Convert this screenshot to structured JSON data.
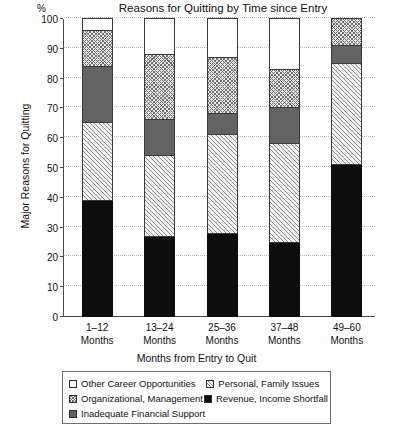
{
  "chart_data": {
    "type": "bar",
    "subtype": "stacked-bar-100",
    "title": "Reasons for Quitting by Time since Entry",
    "xlabel": "Months from Entry to Quit",
    "ylabel": "Major Reasons for Quitting",
    "unit_label": "%",
    "categories": [
      "1–12\nMonths",
      "13–24\nMonths",
      "25–36\nMonths",
      "37–48\nMonths",
      "49–60\nMonths"
    ],
    "category_lines": [
      [
        "1–12",
        "Months"
      ],
      [
        "13–24",
        "Months"
      ],
      [
        "25–36",
        "Months"
      ],
      [
        "37–48",
        "Months"
      ],
      [
        "49–60",
        "Months"
      ]
    ],
    "ylim": [
      0,
      100
    ],
    "yticks": [
      0,
      10,
      20,
      30,
      40,
      50,
      60,
      70,
      80,
      90,
      100
    ],
    "ytick_labels": [
      "0",
      "10",
      "20",
      "30",
      "40",
      "50",
      "60",
      "70",
      "80",
      "90",
      "100"
    ],
    "grid": true,
    "grid_axis": "y",
    "grid_style": "dotted",
    "legend_position": "bottom",
    "stack_order_bottom_to_top": [
      "Revenue, Income Shortfall",
      "Personal, Family Issues",
      "Inadequate Financial Support",
      "Organizational, Management",
      "Other Career Opportunities"
    ],
    "series": [
      {
        "name": "Revenue, Income Shortfall",
        "pattern": "solid-black",
        "color": "#0d0d0d",
        "values": [
          39,
          27,
          28,
          25,
          51
        ]
      },
      {
        "name": "Personal, Family Issues",
        "pattern": "diagonal-hatch",
        "color": "#f2f2f2",
        "values": [
          26,
          27,
          33,
          33,
          34
        ]
      },
      {
        "name": "Inadequate Financial Support",
        "pattern": "solid-dark-gray",
        "color": "#636363",
        "values": [
          19,
          12,
          7,
          12,
          6
        ]
      },
      {
        "name": "Organizational, Management",
        "pattern": "crosshatch-dot",
        "color": "#e8e8e8",
        "values": [
          12,
          22,
          19,
          13,
          9
        ]
      },
      {
        "name": "Other Career Opportunities",
        "pattern": "empty-white",
        "color": "#ffffff",
        "values": [
          4,
          12,
          13,
          17,
          0
        ]
      }
    ],
    "cumulative_tops": [
      [
        39,
        65,
        84,
        96,
        100
      ],
      [
        27,
        54,
        66,
        88,
        100
      ],
      [
        28,
        61,
        68,
        87,
        100
      ],
      [
        25,
        58,
        70,
        83,
        100
      ],
      [
        51,
        85,
        91,
        100,
        100
      ]
    ]
  },
  "legend": {
    "rows": [
      [
        {
          "label": "Other Career Opportunities",
          "swatch": "empty-white"
        },
        {
          "label": "Personal, Family Issues",
          "swatch": "diagonal-hatch"
        }
      ],
      [
        {
          "label": "Organizational, Management",
          "swatch": "crosshatch-dot"
        },
        {
          "label": "Revenue, Income Shortfall",
          "swatch": "solid-black"
        }
      ],
      [
        {
          "label": "Inadequate Financial Support",
          "swatch": "solid-dark-gray"
        }
      ]
    ]
  }
}
